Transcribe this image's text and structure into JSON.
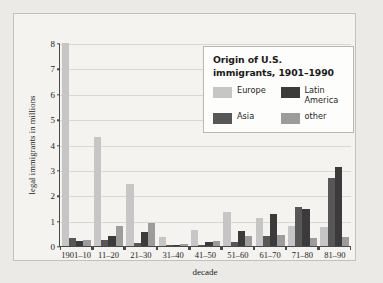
{
  "chart_data": {
    "type": "bar",
    "title": "Origin of U.S. immigrants, 1901–1990",
    "xlabel": "decade",
    "ylabel": "legal immigrants in millions",
    "ylim": [
      0,
      8
    ],
    "yticks": [
      0,
      1,
      2,
      3,
      4,
      5,
      6,
      7,
      8
    ],
    "ytick_labels": [
      "0",
      "1",
      "2",
      "3",
      "4",
      "5",
      "6",
      "7",
      "8"
    ],
    "grid": true,
    "legend_position": "top-right-inside",
    "categories": [
      "1901–10",
      "11–20",
      "21–30",
      "31–40",
      "41–50",
      "51–60",
      "61–70",
      "71–80",
      "81–90"
    ],
    "series": [
      {
        "name": "Europe",
        "color": "#c6c6c6",
        "values": [
          8.0,
          4.3,
          2.45,
          0.35,
          0.62,
          1.33,
          1.1,
          0.78,
          0.76
        ]
      },
      {
        "name": "Asia",
        "color": "#575757",
        "values": [
          0.3,
          0.25,
          0.1,
          0.05,
          0.04,
          0.15,
          0.39,
          1.52,
          2.68
        ]
      },
      {
        "name": "Latin\nAmerica",
        "color": "#3b3b3b",
        "values": [
          0.19,
          0.41,
          0.57,
          0.05,
          0.17,
          0.6,
          1.27,
          1.47,
          3.1
        ]
      },
      {
        "name": "other",
        "color": "#9c9c9c",
        "values": [
          0.23,
          0.79,
          0.9,
          0.09,
          0.21,
          0.39,
          0.45,
          0.3,
          0.36
        ]
      }
    ]
  },
  "legend": {
    "title_line1": "Origin of U.S.",
    "title_line2": "immigrants, 1901–1990",
    "items": [
      {
        "label": "Europe",
        "color": "#c6c6c6"
      },
      {
        "label": "Latin\nAmerica",
        "color": "#3b3b3b"
      },
      {
        "label": "Asia",
        "color": "#575757"
      },
      {
        "label": "other",
        "color": "#9c9c9c"
      }
    ]
  },
  "axes": {
    "x_title": "decade",
    "y_title": "legal immigrants in millions"
  }
}
